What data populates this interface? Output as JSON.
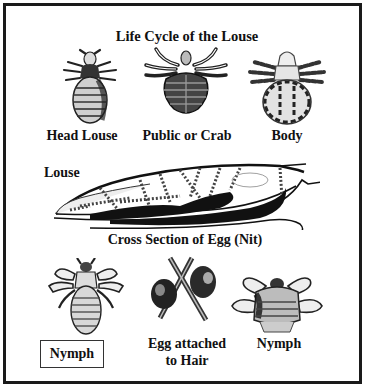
{
  "diagram": {
    "title": "Life Cycle of the Louse",
    "top_row": [
      {
        "label": "Head Louse",
        "icon": "head-louse-illustration"
      },
      {
        "label": "Public or Crab",
        "icon": "crab-louse-illustration"
      },
      {
        "label": "Body",
        "icon": "body-louse-illustration"
      }
    ],
    "middle": {
      "side_label": "Louse",
      "caption": "Cross Section of Egg (Nit)",
      "icon": "egg-cross-section-illustration"
    },
    "bottom_row": [
      {
        "label": "Nymph",
        "boxed": true,
        "icon": "nymph-illustration"
      },
      {
        "label_line1": "Egg attached",
        "label_line2": "to Hair",
        "icon": "egg-on-hair-illustration"
      },
      {
        "label": "Nymph",
        "icon": "nymph-illustration"
      }
    ],
    "colors": {
      "border": "#1a1a1a",
      "ink": "#111111",
      "background": "#ffffff"
    }
  }
}
